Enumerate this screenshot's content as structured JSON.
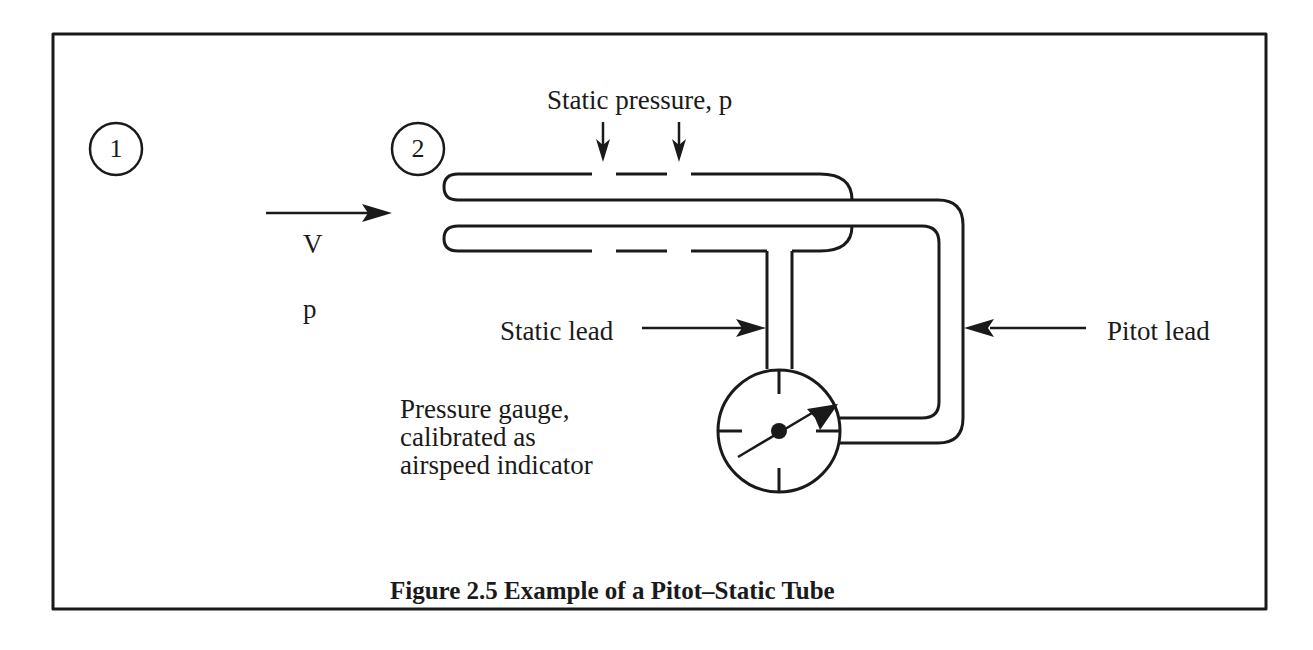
{
  "figure": {
    "caption": "Figure 2.5 Example of a Pitot–Static Tube",
    "stations": [
      {
        "id": "1",
        "label": "1"
      },
      {
        "id": "2",
        "label": "2"
      }
    ],
    "freestream": {
      "velocity_label": "V",
      "pressure_label": "p"
    },
    "labels": {
      "static_pressure": "Static pressure, p",
      "static_lead": "Static lead",
      "pitot_lead": "Pitot lead",
      "gauge": "Pressure gauge,\ncalibrated as\nairspeed indicator"
    },
    "colors": {
      "ink": "#1a1a1a",
      "background": "#ffffff"
    }
  }
}
